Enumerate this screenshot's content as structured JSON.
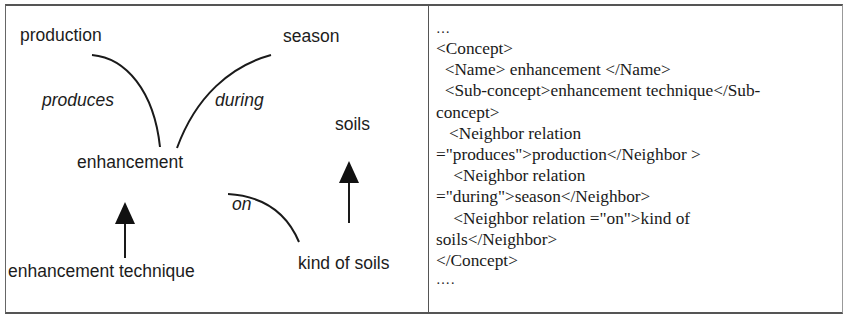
{
  "diagram": {
    "nodes": {
      "production": "production",
      "season": "season",
      "soils": "soils",
      "enhancement": "enhancement",
      "enhancement_technique": "enhancement technique",
      "kind_of_soils": "kind of soils"
    },
    "relations": {
      "produces": "produces",
      "during": "during",
      "on": "on"
    },
    "edges": [
      {
        "from": "enhancement",
        "to": "production",
        "label": "produces",
        "type": "relation-curve"
      },
      {
        "from": "enhancement",
        "to": "season",
        "label": "during",
        "type": "relation-curve"
      },
      {
        "from": "kind of soils",
        "to": "enhancement",
        "label": "on",
        "type": "relation-curve"
      },
      {
        "from": "enhancement technique",
        "to": "enhancement",
        "type": "subconcept-arrow"
      },
      {
        "from": "kind of soils",
        "to": "soils",
        "type": "subconcept-arrow"
      }
    ]
  },
  "xml": {
    "lines": [
      "…",
      "<Concept>",
      "  <Name> enhancement </Name>",
      "  <Sub-concept>enhancement technique</Sub-",
      "concept>",
      "   <Neighbor relation",
      "=\"produces\">production</Neighbor >",
      "    <Neighbor relation",
      "=\"during\">season</Neighbor>",
      "    <Neighbor relation =\"on\">kind of",
      "soils</Neighbor>",
      "</Concept>",
      "…."
    ]
  }
}
